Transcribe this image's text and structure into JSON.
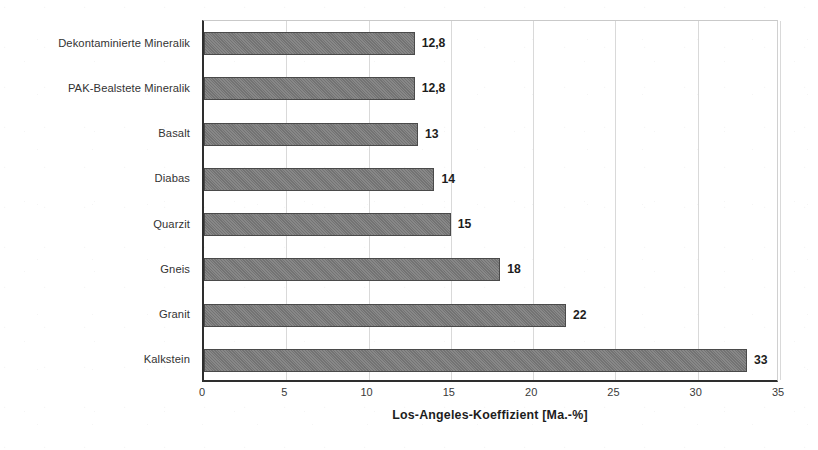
{
  "chart_data": {
    "type": "bar",
    "orientation": "horizontal",
    "title": "",
    "xlabel": "Los-Angeles-Koeffizient [Ma.-%]",
    "ylabel": "",
    "xlim": [
      0,
      35
    ],
    "xticks": [
      0,
      5,
      10,
      15,
      20,
      25,
      30,
      35
    ],
    "xtick_labels": [
      "0",
      "5",
      "10",
      "15",
      "20",
      "25",
      "30",
      "35"
    ],
    "grid": true,
    "grid_axis": "x",
    "legend": false,
    "bar_color": "#7a7a7a",
    "bar_edge_color": "#4a4a4a",
    "axis_color": "#2e2e2e",
    "categories": [
      "Dekontaminierte Mineralik",
      "PAK-Bealstete Mineralik",
      "Basalt",
      "Diabas",
      "Quarzit",
      "Gneis",
      "Granit",
      "Kalkstein"
    ],
    "values": [
      12.8,
      12.8,
      13,
      14,
      15,
      18,
      22,
      33
    ],
    "value_labels": [
      "12,8",
      "12,8",
      "13",
      "14",
      "15",
      "18",
      "22",
      "33"
    ]
  }
}
